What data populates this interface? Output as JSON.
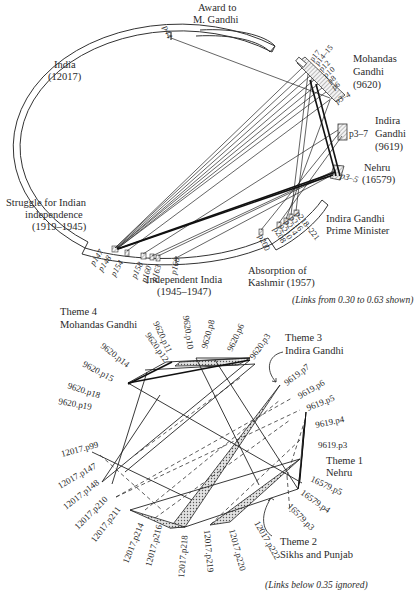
{
  "top_diagram": {
    "segments": {
      "award": {
        "line1": "Award to",
        "line2": "M. Gandhi",
        "page": "p44"
      },
      "india": {
        "line1": "India",
        "line2": "(12017)"
      },
      "mohandas": {
        "line1": "Mohandas",
        "line2": "Gandhi",
        "line3": "(9620)",
        "pages": [
          "p17",
          "p14–15",
          "p12",
          "p10",
          "p8",
          "p6",
          "p3–4"
        ]
      },
      "indira": {
        "line1": "Indira",
        "line2": "Gandhi",
        "line3": "(9619)",
        "pages": "p3–7"
      },
      "nehru": {
        "line1": "Nehru",
        "line2": "(16579)",
        "pages": "p3–5"
      },
      "struggle": {
        "line1": "Struggle for Indian",
        "line2": "independence",
        "line3": "(1919–1945)"
      },
      "independent": {
        "line1": "Independent India",
        "line2": "(1945–1947)"
      },
      "kashmir": {
        "line1": "Absorption of",
        "line2": "Kashmir (1957)"
      },
      "indira_pm": {
        "line1": "Indira Gandhi",
        "line2": "Prime Minister"
      }
    },
    "india_pages": [
      "p147",
      "p148",
      "p154",
      "p158",
      "p160",
      "p163",
      "p168"
    ],
    "india_pages_2": [
      "p200",
      "p208",
      "p210",
      "p214",
      "p216",
      "p218–221"
    ],
    "caption": "(Links from 0.30 to 0.63 shown)"
  },
  "bottom_diagram": {
    "theme4": {
      "line1": "Theme 4",
      "line2": "Mohandas Gandhi"
    },
    "theme3": {
      "line1": "Theme 3",
      "line2": "Indira Gandhi"
    },
    "theme1": {
      "line1": "Theme 1",
      "line2": "Nehru"
    },
    "theme2": {
      "line1": "Theme 2",
      "line2": "Sikhs and Punjab"
    },
    "nodes_9620": [
      "9620.p12",
      "9620.p11",
      "9620.p10",
      "9620.p8",
      "9620.p6",
      "9620.p3",
      "9620.p14",
      "9620.p15",
      "9620.p18",
      "9620.p19"
    ],
    "nodes_9619": [
      "9619.p7",
      "9619.p6",
      "9619.p5",
      "9619.p4",
      "9619.p3"
    ],
    "nodes_16579": [
      "16579.p5",
      "16579.p4",
      "16579.p3"
    ],
    "nodes_12017": [
      "12017.p99",
      "12017.p147",
      "12017.p148",
      "12017.p210",
      "12017.p211",
      "12017.p214",
      "12017.p216",
      "12017.p218",
      "12017.p219",
      "12017.p220",
      "12017.p222"
    ],
    "caption": "(Links below 0.35 ignored)"
  }
}
